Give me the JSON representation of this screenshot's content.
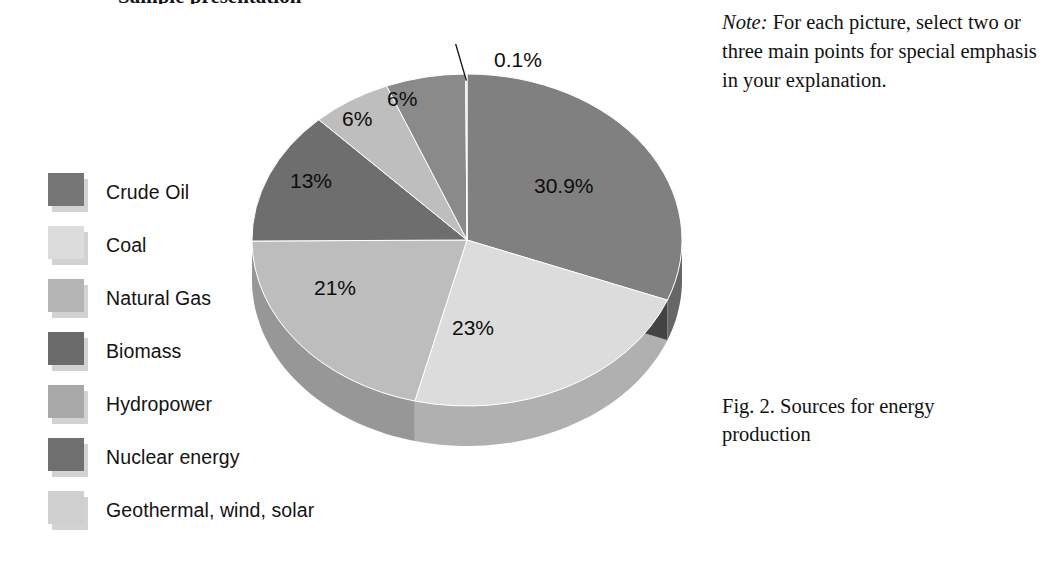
{
  "page": {
    "heading_remnant": "Sample presentation",
    "background": "#ffffff"
  },
  "note": {
    "lead": "Note:",
    "body": " For each picture, select two or three main points for special emphasis in your explanation."
  },
  "caption": {
    "text": "Fig. 2. Sources for energy production"
  },
  "legend": {
    "items": [
      {
        "label": "Crude Oil",
        "color": "#767676"
      },
      {
        "label": "Coal",
        "color": "#dcdcdc"
      },
      {
        "label": "Natural Gas",
        "color": "#b4b4b4"
      },
      {
        "label": "Biomass",
        "color": "#6b6b6b"
      },
      {
        "label": "Hydropower",
        "color": "#a9a9a9"
      },
      {
        "label": "Nuclear energy",
        "color": "#6f6f6f"
      },
      {
        "label": "Geothermal, wind, solar",
        "color": "#cfcfcf"
      }
    ]
  },
  "chart_data": {
    "type": "pie",
    "title": "Fig. 2. Sources for energy production",
    "subtitle": "",
    "xlabel": "",
    "ylabel": "",
    "legend_position": "left",
    "style": "3d-pie",
    "start_angle_deg": 0,
    "direction": "clockwise",
    "categories": [
      "Crude Oil",
      "Coal",
      "Natural Gas",
      "Biomass",
      "Hydropower",
      "Nuclear energy",
      "Geothermal, wind, solar"
    ],
    "values": [
      30.9,
      23,
      21,
      13,
      6,
      6,
      0.1
    ],
    "labels": [
      "30.9%",
      "23%",
      "21%",
      "13%",
      "6%",
      "6%",
      "0.1%"
    ],
    "colors": [
      "#808080",
      "#dcdcdc",
      "#bdbdbd",
      "#6e6e6e",
      "#bebebe",
      "#8a8a8a",
      "#d6d6d6"
    ],
    "callout_slices": [
      "Geothermal, wind, solar"
    ],
    "slice_label_positions": [
      {
        "label": "30.9%",
        "left": 302,
        "top": 130
      },
      {
        "label": "23%",
        "left": 220,
        "top": 272
      },
      {
        "label": "21%",
        "left": 82,
        "top": 232
      },
      {
        "label": "13%",
        "left": 58,
        "top": 125
      },
      {
        "label": "6%",
        "left": 110,
        "top": 63
      },
      {
        "label": "6%",
        "left": 155,
        "top": 43
      }
    ],
    "callout_label": {
      "text": "0.1%",
      "left": 262,
      "top": 4
    }
  }
}
